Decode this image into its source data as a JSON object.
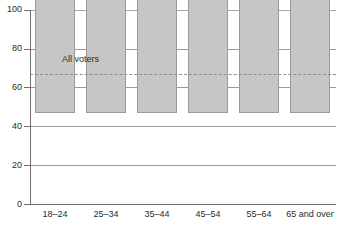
{
  "chart_data": {
    "type": "bar",
    "title": "",
    "xlabel": "",
    "ylabel": "",
    "categories": [
      "18–24",
      "25–34",
      "35–44",
      "45–54",
      "55–64",
      "65 and over"
    ],
    "values": [
      45,
      53,
      71,
      76,
      84,
      87
    ],
    "ylim": [
      0,
      100
    ],
    "yticks": [
      0,
      20,
      40,
      60,
      80,
      100
    ],
    "ytick_labels": [
      "0",
      "20",
      "40",
      "60",
      "80",
      "100"
    ],
    "grid": true,
    "grid_axis": "y",
    "legend": "none",
    "annotations": [
      {
        "name": "all-voters-reference",
        "label": "All voters",
        "value": 67,
        "style": "dashed-horizontal-line"
      }
    ],
    "colors": {
      "bar_fill": "#c6c6c6",
      "bar_stroke": "#9b9b9b",
      "gridline": "#9a9a9a",
      "axis": "#6e6e6e",
      "reference_line": "#8e8e8e",
      "text": "#2b2b2b",
      "background": "#ffffff"
    }
  }
}
